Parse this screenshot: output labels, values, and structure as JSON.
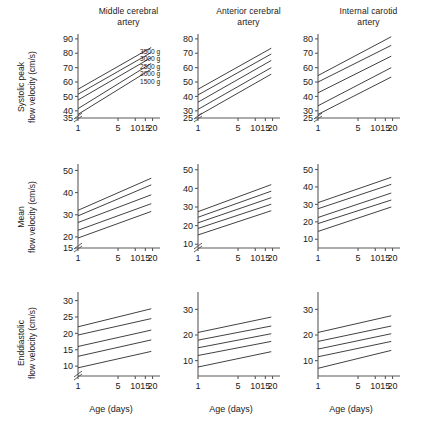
{
  "figure": {
    "column_headers": [
      {
        "line1": "Middle cerebral",
        "line2": "artery"
      },
      {
        "line1": "Anterior cerebral",
        "line2": "artery"
      },
      {
        "line1": "Internal carotid",
        "line2": "artery"
      }
    ],
    "row_labels": [
      {
        "line1": "Systolic peak",
        "line2": "flow velocity (cm/s)"
      },
      {
        "line1": "Mean",
        "line2": "flow velocity (cm/s)"
      },
      {
        "line1": "Enddiastolic",
        "line2": "flow velocity (cm/s)"
      }
    ],
    "xlabel": "Age (days)",
    "legend": {
      "entries": [
        "3500 g",
        "3000 g",
        "2500 g",
        "2000 g",
        "1500 g"
      ]
    },
    "line_color": "#2b2b2b",
    "axis_color": "#5a5a5a"
  },
  "chart_data": [
    {
      "id": "systolic-mca",
      "type": "line",
      "title": "Middle cerebral artery",
      "row": "Systolic peak",
      "xlabel": "Age (days)",
      "ylabel": "Systolic peak flow velocity (cm/s)",
      "x": [
        1,
        5,
        10,
        15,
        20
      ],
      "xticks": [
        1,
        5,
        10,
        15,
        20
      ],
      "xlim": [
        1,
        23
      ],
      "yticks": [
        35,
        40,
        50,
        60,
        70,
        80,
        90
      ],
      "ylim": [
        35,
        92
      ],
      "axis_break": true,
      "grid": false,
      "legend_position": "inside-top-right",
      "series": [
        {
          "name": "3500 g",
          "x": [
            1,
            19
          ],
          "values": [
            55.0,
            84.0
          ]
        },
        {
          "name": "3000 g",
          "x": [
            1,
            19
          ],
          "values": [
            51.5,
            80.5
          ]
        },
        {
          "name": "2500 g",
          "x": [
            1,
            19
          ],
          "values": [
            47.5,
            77.0
          ]
        },
        {
          "name": "2000 g",
          "x": [
            1,
            19
          ],
          "values": [
            41.5,
            73.0
          ]
        },
        {
          "name": "1500 g",
          "x": [
            1,
            19
          ],
          "values": [
            37.5,
            69.0
          ]
        }
      ]
    },
    {
      "id": "systolic-aca",
      "type": "line",
      "title": "Anterior cerebral artery",
      "row": "Systolic peak",
      "xlabel": "Age (days)",
      "ylabel": "Systolic peak flow velocity (cm/s)",
      "x": [
        1,
        5,
        10,
        15,
        20
      ],
      "xticks": [
        1,
        5,
        10,
        15,
        20
      ],
      "xlim": [
        1,
        23
      ],
      "yticks": [
        25,
        30,
        40,
        50,
        60,
        70,
        80
      ],
      "ylim": [
        25,
        82
      ],
      "axis_break": true,
      "grid": false,
      "legend_position": "none",
      "series": [
        {
          "name": "3500 g",
          "x": [
            1,
            19
          ],
          "values": [
            45.0,
            73.5
          ]
        },
        {
          "name": "3000 g",
          "x": [
            1,
            19
          ],
          "values": [
            41.0,
            69.5
          ]
        },
        {
          "name": "2500 g",
          "x": [
            1,
            19
          ],
          "values": [
            36.0,
            65.0
          ]
        },
        {
          "name": "2000 g",
          "x": [
            1,
            19
          ],
          "values": [
            31.0,
            60.0
          ]
        },
        {
          "name": "1500 g",
          "x": [
            1,
            19
          ],
          "values": [
            26.5,
            55.5
          ]
        }
      ]
    },
    {
      "id": "systolic-ica",
      "type": "line",
      "title": "Internal carotid artery",
      "row": "Systolic peak",
      "xlabel": "Age (days)",
      "ylabel": "Systolic peak flow velocity (cm/s)",
      "x": [
        1,
        5,
        10,
        15,
        20
      ],
      "xticks": [
        1,
        5,
        10,
        15,
        20
      ],
      "xlim": [
        1,
        23
      ],
      "yticks": [
        25,
        30,
        40,
        50,
        60,
        70,
        80
      ],
      "ylim": [
        25,
        82
      ],
      "axis_break": true,
      "grid": false,
      "legend_position": "none",
      "series": [
        {
          "name": "3500 g",
          "x": [
            1,
            19
          ],
          "values": [
            54.5,
            81.5
          ]
        },
        {
          "name": "3000 g",
          "x": [
            1,
            19
          ],
          "values": [
            50.0,
            75.5
          ]
        },
        {
          "name": "2500 g",
          "x": [
            1,
            19
          ],
          "values": [
            42.5,
            68.0
          ]
        },
        {
          "name": "2000 g",
          "x": [
            1,
            19
          ],
          "values": [
            33.5,
            60.0
          ]
        },
        {
          "name": "1500 g",
          "x": [
            1,
            19
          ],
          "values": [
            27.5,
            53.5
          ]
        }
      ]
    },
    {
      "id": "mean-mca",
      "type": "line",
      "title": "Middle cerebral artery",
      "row": "Mean",
      "xlabel": "Age (days)",
      "ylabel": "Mean flow velocity (cm/s)",
      "x": [
        1,
        5,
        10,
        15,
        20
      ],
      "xticks": [
        1,
        5,
        10,
        15,
        20
      ],
      "xlim": [
        1,
        23
      ],
      "yticks": [
        15,
        20,
        30,
        40,
        50
      ],
      "ylim": [
        15,
        52
      ],
      "axis_break": true,
      "grid": false,
      "legend_position": "none",
      "series": [
        {
          "name": "3500 g",
          "x": [
            1,
            19
          ],
          "values": [
            32.0,
            46.5
          ]
        },
        {
          "name": "3000 g",
          "x": [
            1,
            19
          ],
          "values": [
            29.5,
            43.5
          ]
        },
        {
          "name": "2500 g",
          "x": [
            1,
            19
          ],
          "values": [
            26.5,
            39.0
          ]
        },
        {
          "name": "2000 g",
          "x": [
            1,
            19
          ],
          "values": [
            23.0,
            35.0
          ]
        },
        {
          "name": "1500 g",
          "x": [
            1,
            19
          ],
          "values": [
            19.5,
            31.5
          ]
        }
      ]
    },
    {
      "id": "mean-aca",
      "type": "line",
      "title": "Anterior cerebral artery",
      "row": "Mean",
      "xlabel": "Age (days)",
      "ylabel": "Mean flow velocity (cm/s)",
      "x": [
        1,
        5,
        10,
        15,
        20
      ],
      "xticks": [
        1,
        5,
        10,
        15,
        20
      ],
      "xlim": [
        1,
        23
      ],
      "yticks": [
        10,
        20,
        30,
        40,
        50
      ],
      "ylim": [
        8,
        52
      ],
      "axis_break": true,
      "grid": false,
      "legend_position": "none",
      "series": [
        {
          "name": "3500 g",
          "x": [
            1,
            19
          ],
          "values": [
            27.5,
            42.0
          ]
        },
        {
          "name": "3000 g",
          "x": [
            1,
            19
          ],
          "values": [
            24.5,
            38.5
          ]
        },
        {
          "name": "2500 g",
          "x": [
            1,
            19
          ],
          "values": [
            21.5,
            35.0
          ]
        },
        {
          "name": "2000 g",
          "x": [
            1,
            19
          ],
          "values": [
            18.5,
            31.5
          ]
        },
        {
          "name": "1500 g",
          "x": [
            1,
            19
          ],
          "values": [
            15.0,
            28.0
          ]
        }
      ]
    },
    {
      "id": "mean-ica",
      "type": "line",
      "title": "Internal carotid artery",
      "row": "Mean",
      "xlabel": "Age (days)",
      "ylabel": "Mean flow velocity (cm/s)",
      "x": [
        1,
        5,
        10,
        15,
        20
      ],
      "xticks": [
        1,
        5,
        10,
        15,
        20
      ],
      "xlim": [
        1,
        23
      ],
      "yticks": [
        10,
        20,
        30,
        40,
        50
      ],
      "ylim": [
        5,
        52
      ],
      "axis_break": false,
      "grid": false,
      "legend_position": "none",
      "series": [
        {
          "name": "3500 g",
          "x": [
            1,
            19
          ],
          "values": [
            31.0,
            45.5
          ]
        },
        {
          "name": "3000 g",
          "x": [
            1,
            19
          ],
          "values": [
            27.5,
            41.5
          ]
        },
        {
          "name": "2500 g",
          "x": [
            1,
            19
          ],
          "values": [
            22.5,
            36.5
          ]
        },
        {
          "name": "2000 g",
          "x": [
            1,
            19
          ],
          "values": [
            19.0,
            32.5
          ]
        },
        {
          "name": "1500 g",
          "x": [
            1,
            19
          ],
          "values": [
            14.5,
            28.5
          ]
        }
      ]
    },
    {
      "id": "enddiastolic-mca",
      "type": "line",
      "title": "Middle cerebral artery",
      "row": "Enddiastolic",
      "xlabel": "Age (days)",
      "ylabel": "Enddiastolic flow velocity (cm/s)",
      "x": [
        1,
        5,
        10,
        15,
        20
      ],
      "xticks": [
        1,
        5,
        10,
        15,
        20
      ],
      "xlim": [
        1,
        23
      ],
      "yticks": [
        10,
        15,
        20,
        25,
        30
      ],
      "ylim": [
        7,
        32
      ],
      "axis_break": true,
      "grid": false,
      "legend_position": "none",
      "series": [
        {
          "name": "3500 g",
          "x": [
            1,
            19
          ],
          "values": [
            22.0,
            27.5
          ]
        },
        {
          "name": "3000 g",
          "x": [
            1,
            19
          ],
          "values": [
            19.5,
            24.5
          ]
        },
        {
          "name": "2500 g",
          "x": [
            1,
            19
          ],
          "values": [
            16.0,
            21.0
          ]
        },
        {
          "name": "2000 g",
          "x": [
            1,
            19
          ],
          "values": [
            13.0,
            18.0
          ]
        },
        {
          "name": "1500 g",
          "x": [
            1,
            19
          ],
          "values": [
            9.5,
            14.5
          ]
        }
      ]
    },
    {
      "id": "enddiastolic-aca",
      "type": "line",
      "title": "Anterior cerebral artery",
      "row": "Enddiastolic",
      "xlabel": "Age (days)",
      "ylabel": "Enddiastolic flow velocity (cm/s)",
      "x": [
        1,
        5,
        10,
        15,
        20
      ],
      "xticks": [
        1,
        5,
        10,
        15,
        20
      ],
      "xlim": [
        1,
        23
      ],
      "yticks": [
        10,
        20,
        30
      ],
      "ylim": [
        4,
        36
      ],
      "axis_break": false,
      "grid": false,
      "legend_position": "none",
      "series": [
        {
          "name": "3500 g",
          "x": [
            1,
            19
          ],
          "values": [
            21.0,
            27.0
          ]
        },
        {
          "name": "3000 g",
          "x": [
            1,
            19
          ],
          "values": [
            18.0,
            23.5
          ]
        },
        {
          "name": "2500 g",
          "x": [
            1,
            19
          ],
          "values": [
            15.0,
            20.5
          ]
        },
        {
          "name": "2000 g",
          "x": [
            1,
            19
          ],
          "values": [
            12.0,
            17.5
          ]
        },
        {
          "name": "1500 g",
          "x": [
            1,
            19
          ],
          "values": [
            7.5,
            13.5
          ]
        }
      ]
    },
    {
      "id": "enddiastolic-ica",
      "type": "line",
      "title": "Internal carotid artery",
      "row": "Enddiastolic",
      "xlabel": "Age (days)",
      "ylabel": "Enddiastolic flow velocity (cm/s)",
      "x": [
        1,
        5,
        10,
        15,
        20
      ],
      "xticks": [
        1,
        5,
        10,
        15,
        20
      ],
      "xlim": [
        1,
        23
      ],
      "yticks": [
        10,
        20,
        30
      ],
      "ylim": [
        4,
        36
      ],
      "axis_break": false,
      "grid": false,
      "legend_position": "none",
      "series": [
        {
          "name": "3500 g",
          "x": [
            1,
            19
          ],
          "values": [
            21.0,
            27.5
          ]
        },
        {
          "name": "3000 g",
          "x": [
            1,
            19
          ],
          "values": [
            17.5,
            23.5
          ]
        },
        {
          "name": "2500 g",
          "x": [
            1,
            19
          ],
          "values": [
            14.5,
            20.5
          ]
        },
        {
          "name": "2000 g",
          "x": [
            1,
            19
          ],
          "values": [
            11.5,
            17.5
          ]
        },
        {
          "name": "1500 g",
          "x": [
            1,
            19
          ],
          "values": [
            7.0,
            14.0
          ]
        }
      ]
    }
  ]
}
